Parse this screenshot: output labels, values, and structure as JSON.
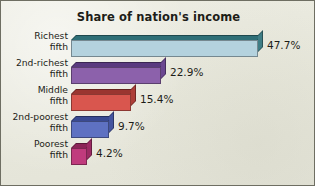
{
  "chart_data": {
    "type": "bar",
    "orientation": "horizontal",
    "title": "Share of nation's income",
    "xlabel": "",
    "ylabel": "",
    "categories": [
      "Richest fifth",
      "2nd-richest fifth",
      "Middle fifth",
      "2nd-poorest fifth",
      "Poorest fifth"
    ],
    "values": [
      47.7,
      22.9,
      15.4,
      9.7,
      4.2
    ],
    "value_labels": [
      "47.7%",
      "22.9%",
      "15.4%",
      "9.7%",
      "4.2%"
    ],
    "xlim": [
      0,
      50
    ],
    "grid": false,
    "legend": "none",
    "bars": [
      {
        "label_line1": "Richest",
        "label_line2": "fifth",
        "value": 47.7,
        "value_label": "47.7%",
        "face_color": "#b4d2de",
        "top_color": "#2f6f77",
        "side_color": "#3f7d85"
      },
      {
        "label_line1": "2nd-richest",
        "label_line2": "fifth",
        "value": 22.9,
        "value_label": "22.9%",
        "face_color": "#8c61ab",
        "top_color": "#5a3a7f",
        "side_color": "#6b4791"
      },
      {
        "label_line1": "Middle",
        "label_line2": "fifth",
        "value": 15.4,
        "value_label": "15.4%",
        "face_color": "#d9564e",
        "top_color": "#9b3530",
        "side_color": "#ad3f39"
      },
      {
        "label_line1": "2nd-poorest",
        "label_line2": "fifth",
        "value": 9.7,
        "value_label": "9.7%",
        "face_color": "#5e71c2",
        "top_color": "#3a4a92",
        "side_color": "#45559f"
      },
      {
        "label_line1": "Poorest",
        "label_line2": "fifth",
        "value": 4.2,
        "value_label": "4.2%",
        "face_color": "#c03b7d",
        "top_color": "#8b2457",
        "side_color": "#9c2b64"
      }
    ],
    "background_color": "#e9e9de",
    "frame_color": "#6e6e62",
    "text_color": "#1d1d18"
  }
}
